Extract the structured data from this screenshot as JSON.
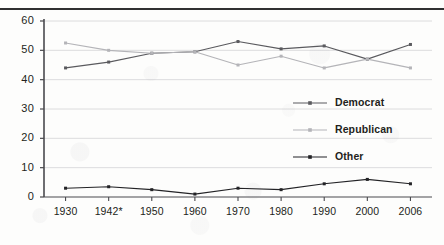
{
  "chart_data": {
    "type": "line",
    "title": "",
    "subtitle": "",
    "xlabel": "",
    "ylabel": "",
    "categories": [
      "1930",
      "1942*",
      "1950",
      "1960",
      "1970",
      "1980",
      "1990",
      "2000",
      "2006"
    ],
    "series": [
      {
        "name": "Democrat",
        "color": "#5a5a5e",
        "values": [
          44,
          46,
          49,
          49.5,
          53,
          50.5,
          51.5,
          47,
          52
        ]
      },
      {
        "name": "Republican",
        "color": "#b4b4b8",
        "values": [
          52.5,
          50,
          49,
          49.5,
          45,
          48,
          44,
          47,
          44
        ]
      },
      {
        "name": "Other",
        "color": "#232326",
        "values": [
          3,
          3.5,
          2.5,
          1,
          3,
          2.5,
          4.5,
          6,
          4.5
        ]
      }
    ],
    "ylim": [
      0,
      60
    ],
    "yticks": [
      0,
      10,
      20,
      30,
      40,
      50,
      60
    ],
    "ytick_labels": [
      "0",
      "10",
      "20",
      "30",
      "40",
      "50",
      "60"
    ],
    "grid": true,
    "grid_color": "#d8d8da",
    "legend_position": "inside-lower-right",
    "axis_color": "#4a4a4e",
    "text_color": "#231f20"
  },
  "legend": {
    "entries": [
      {
        "label": "Democrat"
      },
      {
        "label": "Republican"
      },
      {
        "label": "Other"
      }
    ]
  }
}
